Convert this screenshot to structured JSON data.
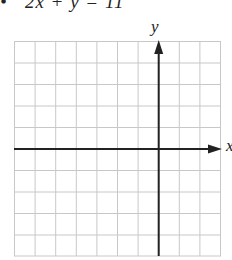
{
  "problem": {
    "equation_partial": "•   2x + y = 11"
  },
  "graph": {
    "x_label": "x",
    "y_label": "y",
    "grid": {
      "columns": 10,
      "rows": 10,
      "color": "#c8c8c8"
    },
    "axis_color": "#222222",
    "origin": {
      "col": 7,
      "row": 5
    }
  }
}
